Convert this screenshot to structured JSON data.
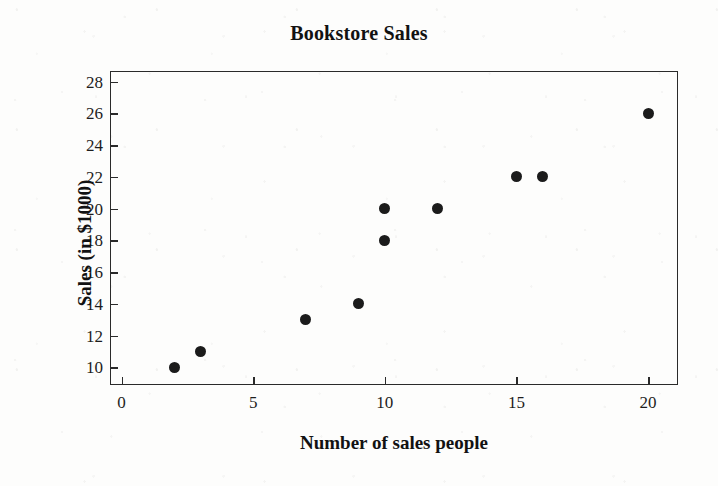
{
  "chart_data": {
    "type": "scatter",
    "title": "Bookstore Sales",
    "xlabel": "Number of sales people",
    "ylabel": "Sales (in $1000)",
    "x": [
      2,
      3,
      7,
      9,
      10,
      10,
      12,
      15,
      16,
      20
    ],
    "y": [
      10,
      11,
      13,
      14,
      18,
      20,
      20,
      22,
      22,
      26
    ],
    "points": [
      {
        "x": 2,
        "y": 10
      },
      {
        "x": 3,
        "y": 11
      },
      {
        "x": 7,
        "y": 13
      },
      {
        "x": 9,
        "y": 14
      },
      {
        "x": 10,
        "y": 18
      },
      {
        "x": 10,
        "y": 20
      },
      {
        "x": 12,
        "y": 20
      },
      {
        "x": 15,
        "y": 22
      },
      {
        "x": 16,
        "y": 22
      },
      {
        "x": 20,
        "y": 26
      }
    ],
    "xlim": [
      -0.4,
      21.1
    ],
    "ylim": [
      8.95,
      28.6
    ],
    "xticks": [
      0,
      5,
      10,
      15,
      20
    ],
    "xticklabels": [
      "0",
      "5",
      "10",
      "15",
      "20"
    ],
    "yticks": [
      10,
      12,
      14,
      16,
      18,
      20,
      22,
      24,
      26,
      28
    ],
    "yticklabels": [
      "10",
      "12",
      "14",
      "16",
      "18",
      "20",
      "22",
      "24",
      "26",
      "28"
    ],
    "grid": false,
    "legend": false,
    "marker_color": "#1b1b1b",
    "frame_color": "#2a2a2a",
    "background_color": "#fdfdfc"
  }
}
